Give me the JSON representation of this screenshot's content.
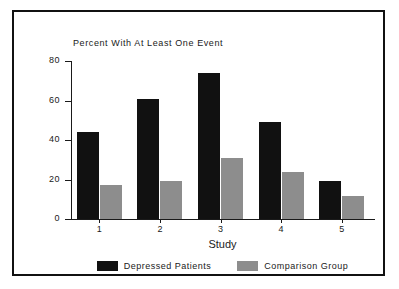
{
  "chart_data": {
    "type": "bar",
    "title": "Percent With At Least One Event",
    "xlabel": "Study",
    "ylabel": "",
    "categories": [
      "1",
      "2",
      "3",
      "4",
      "5"
    ],
    "series": [
      {
        "name": "Depressed Patients",
        "color": "#111111",
        "values": [
          44,
          61,
          74,
          49,
          19
        ]
      },
      {
        "name": "Comparison Group",
        "color": "#8d8d8d",
        "values": [
          17,
          19.5,
          31,
          24,
          11.5
        ]
      }
    ],
    "ylim": [
      0,
      80
    ],
    "yticks": [
      0,
      20,
      40,
      60,
      80
    ],
    "ytick_labels": [
      "0",
      "20",
      "40",
      "60",
      "80"
    ],
    "grid": false,
    "legend_position": "bottom"
  },
  "figure": {
    "border_color": "#111111",
    "background": "#ffffff"
  }
}
